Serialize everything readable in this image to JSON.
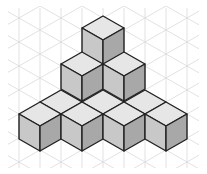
{
  "figure": {
    "cube_count": 10,
    "layers": [
      {
        "level": 1,
        "cubes": 7
      },
      {
        "level": 2,
        "cubes": 2
      },
      {
        "level": 3,
        "cubes": 1
      }
    ]
  },
  "geometry": {
    "half_width": 21,
    "rhombus_half_height": 12,
    "side_height": 25
  },
  "colors": {
    "background": "#ffffff",
    "grid": "#d9d9d9",
    "edge": "#222222",
    "top_face": "#e6e6e6",
    "left_face": "#c8c8c8",
    "right_face": "#a8a8a8"
  },
  "tiles": [
    {
      "x": 61,
      "y": 102
    },
    {
      "x": 103,
      "y": 102
    },
    {
      "x": 145,
      "y": 102
    }
  ],
  "cubes": [
    {
      "x": 103,
      "y": 40,
      "level": 3
    },
    {
      "x": 82,
      "y": 76,
      "level": 2
    },
    {
      "x": 124,
      "y": 76,
      "level": 2
    },
    {
      "x": 40,
      "y": 126,
      "level": 1
    },
    {
      "x": 82,
      "y": 126,
      "level": 1
    },
    {
      "x": 124,
      "y": 126,
      "level": 1
    },
    {
      "x": 166,
      "y": 126,
      "level": 1
    }
  ]
}
